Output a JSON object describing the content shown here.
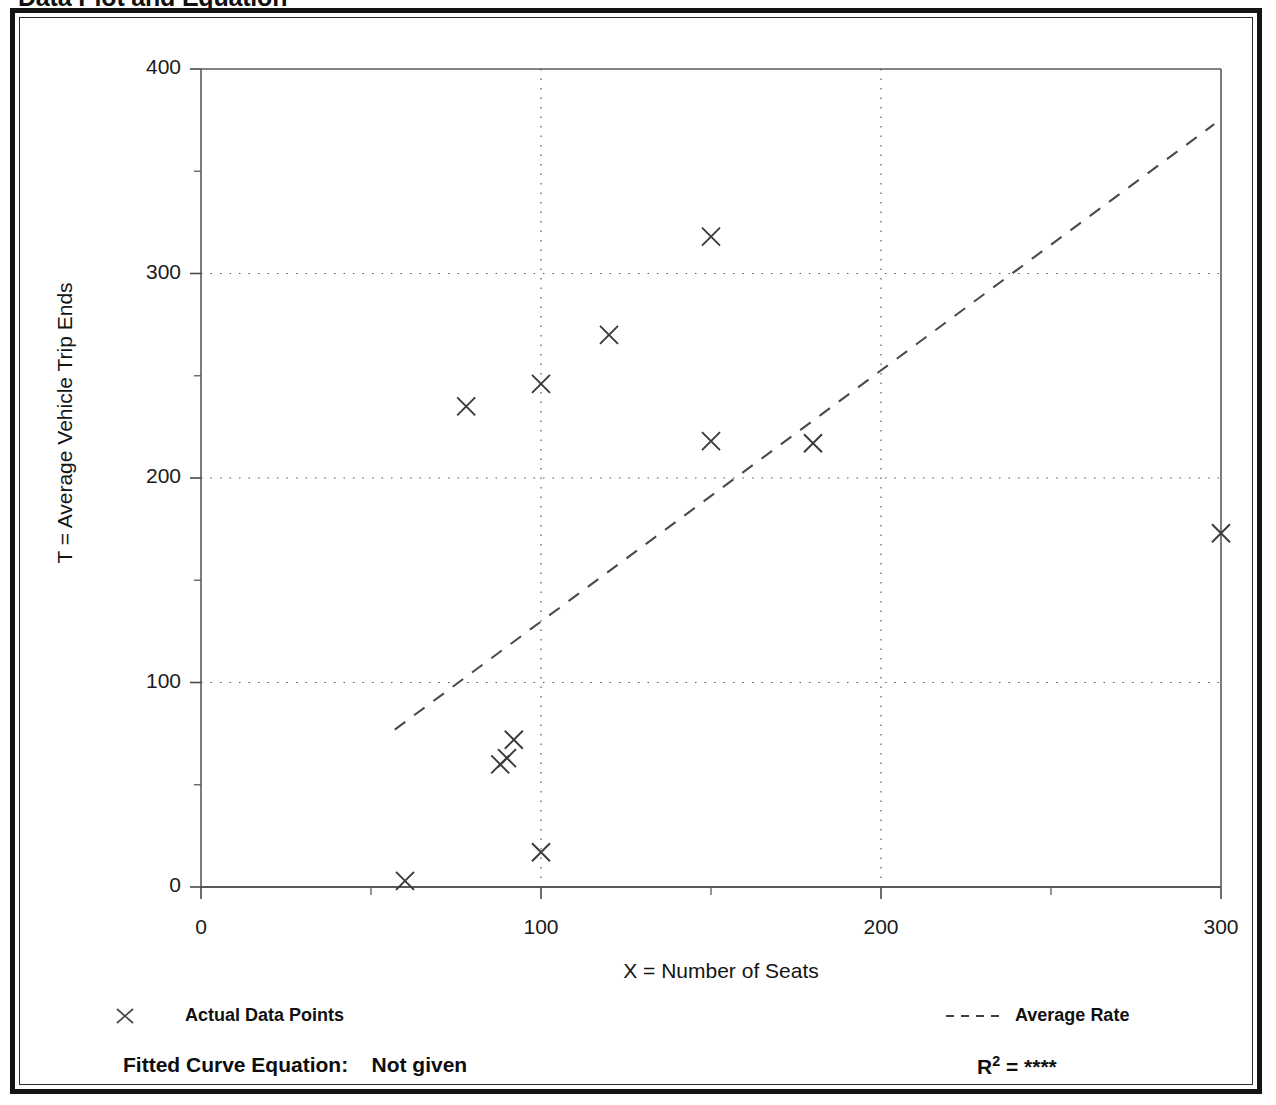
{
  "page": {
    "title": "Data Plot and Equation",
    "background_color": "#ffffff",
    "frame_color": "#141414"
  },
  "axis": {
    "y_title": "T = Average Vehicle Trip Ends",
    "x_title": "X = Number of Seats",
    "y_ticks": [
      "0",
      "100",
      "200",
      "300",
      "400"
    ],
    "x_ticks": [
      "0",
      "100",
      "200",
      "300"
    ]
  },
  "legend": {
    "points": {
      "label": "Actual Data Points",
      "marker": "x-marker-icon",
      "color": "#3a3a3a"
    },
    "rate": {
      "label": "Average Rate",
      "marker": "dashed-line-icon",
      "color": "#3a3a3a"
    }
  },
  "footer": {
    "fitted_curve_label": "Fitted Curve Equation:",
    "fitted_curve_value": "Not given",
    "r_label": "R",
    "r_exponent": "2",
    "r_equals": " = ",
    "r_value": "****"
  },
  "chart_data": {
    "type": "scatter",
    "title": "Data Plot and Equation",
    "xlabel": "X = Number of Seats",
    "ylabel": "T = Average Vehicle Trip Ends",
    "xlim": [
      0,
      300
    ],
    "ylim": [
      0,
      400
    ],
    "xticks": [
      0,
      100,
      200,
      300
    ],
    "yticks": [
      0,
      100,
      200,
      300,
      400
    ],
    "x_minor_ticks": [
      50,
      150,
      250
    ],
    "y_minor_ticks": [
      50,
      150,
      250,
      350
    ],
    "grid": true,
    "grid_style": "dotted",
    "grid_x": [
      100,
      200
    ],
    "grid_y": [
      100,
      200,
      300
    ],
    "legend_position": "below-axes",
    "series": [
      {
        "name": "Actual Data Points",
        "type": "scatter",
        "marker": "x",
        "color": "#3a3a3a",
        "points": [
          {
            "x": 60,
            "y": 3
          },
          {
            "x": 78,
            "y": 235
          },
          {
            "x": 88,
            "y": 60
          },
          {
            "x": 90,
            "y": 63
          },
          {
            "x": 92,
            "y": 72
          },
          {
            "x": 100,
            "y": 17
          },
          {
            "x": 100,
            "y": 246
          },
          {
            "x": 120,
            "y": 270
          },
          {
            "x": 150,
            "y": 218
          },
          {
            "x": 150,
            "y": 318
          },
          {
            "x": 180,
            "y": 217
          },
          {
            "x": 300,
            "y": 173
          }
        ]
      },
      {
        "name": "Average Rate",
        "type": "line",
        "style": "dashed",
        "color": "#4a4a4a",
        "points": [
          {
            "x": 57,
            "y": 77
          },
          {
            "x": 298,
            "y": 373
          }
        ]
      }
    ]
  }
}
